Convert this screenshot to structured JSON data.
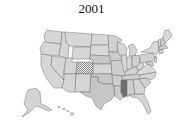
{
  "title": "2001",
  "map": {
    "type": "choropleth",
    "region": "United States",
    "colors": {
      "light": "#d8d8d8",
      "medium": "#c2c2c2",
      "dark": "#6e6e6e",
      "hatched_bg": "#e8e8e8",
      "hatched_fg": "#8a8a8a",
      "border": "#6a6a6a"
    },
    "highlighted_states": [
      {
        "state": "Colorado",
        "fill": "hatched"
      },
      {
        "state": "Mississippi",
        "fill": "dark"
      }
    ]
  }
}
